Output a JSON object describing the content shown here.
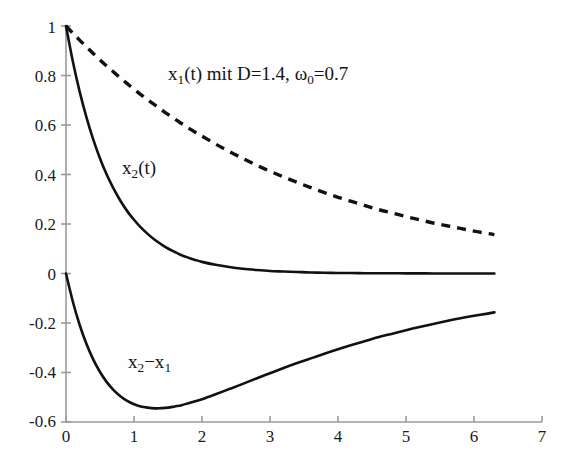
{
  "chart_data": {
    "type": "line",
    "title": "",
    "xlabel": "",
    "ylabel": "",
    "xlim": [
      0,
      7
    ],
    "ylim": [
      -0.6,
      1
    ],
    "grid": false,
    "legend_position": "inline-annotations",
    "annotation_main": "x₁(t)  mit D=1.4, ω₀=0.7",
    "annotation_main_parts": {
      "base1": "x",
      "sub1": "1",
      "mid": "(t)  mit D=1.4, ",
      "omega": "ω",
      "sub2": "0",
      "tail": "=0.7"
    },
    "xticks": [
      0,
      1,
      2,
      3,
      4,
      5,
      6,
      7
    ],
    "xtick_labels": [
      "0",
      "1",
      "2",
      "3",
      "4",
      "5",
      "6",
      "7"
    ],
    "yticks": [
      -0.6,
      -0.4,
      -0.2,
      0,
      0.2,
      0.4,
      0.6,
      0.8,
      1
    ],
    "ytick_labels": [
      "-0.6",
      "-0.4",
      "-0.2",
      "0",
      "0.2",
      "0.4",
      "0.6",
      "0.8",
      "1"
    ],
    "x": [
      0,
      0.1,
      0.2,
      0.3,
      0.4,
      0.5,
      0.6,
      0.7,
      0.8,
      0.9,
      1,
      1.1,
      1.2,
      1.3,
      1.4,
      1.5,
      1.6,
      1.7,
      1.8,
      1.9,
      2,
      2.2,
      2.4,
      2.6,
      2.8,
      3,
      3.2,
      3.4,
      3.6,
      3.8,
      4,
      4.2,
      4.4,
      4.6,
      4.8,
      5,
      5.2,
      5.4,
      5.6,
      5.8,
      6,
      6.2,
      6.3
    ],
    "series": [
      {
        "name": "x₁(t)",
        "label": "x1",
        "style": "dashed",
        "color": "#111111",
        "values": [
          1,
          0.971,
          0.943,
          0.916,
          0.889,
          0.863,
          0.838,
          0.814,
          0.79,
          0.767,
          0.745,
          0.723,
          0.702,
          0.682,
          0.662,
          0.643,
          0.624,
          0.606,
          0.588,
          0.571,
          0.555,
          0.523,
          0.493,
          0.465,
          0.438,
          0.413,
          0.39,
          0.368,
          0.347,
          0.327,
          0.308,
          0.291,
          0.274,
          0.258,
          0.244,
          0.23,
          0.217,
          0.204,
          0.193,
          0.182,
          0.171,
          0.162,
          0.157
        ]
      },
      {
        "name": "x₂(t)",
        "label": "x2",
        "style": "solid",
        "color": "#111111",
        "values": [
          1,
          0.858,
          0.736,
          0.632,
          0.542,
          0.465,
          0.399,
          0.343,
          0.294,
          0.252,
          0.217,
          0.186,
          0.16,
          0.137,
          0.118,
          0.101,
          0.087,
          0.074,
          0.064,
          0.055,
          0.047,
          0.035,
          0.026,
          0.019,
          0.014,
          0.01,
          0.008,
          0.006,
          0.004,
          0.003,
          0.002,
          0.002,
          0.001,
          0.001,
          0.001,
          0.0005,
          0.0004,
          0.0003,
          0.0002,
          0.0002,
          0.0001,
          0.0001,
          0.0001
        ]
      },
      {
        "name": "x₂−x₁",
        "label": "x2-x1",
        "style": "solid",
        "color": "#111111",
        "values": [
          0,
          -0.113,
          -0.207,
          -0.284,
          -0.347,
          -0.398,
          -0.439,
          -0.471,
          -0.496,
          -0.515,
          -0.528,
          -0.537,
          -0.542,
          -0.545,
          -0.544,
          -0.542,
          -0.537,
          -0.532,
          -0.524,
          -0.516,
          -0.508,
          -0.488,
          -0.467,
          -0.446,
          -0.424,
          -0.403,
          -0.382,
          -0.362,
          -0.343,
          -0.324,
          -0.306,
          -0.289,
          -0.273,
          -0.257,
          -0.243,
          -0.229,
          -0.216,
          -0.204,
          -0.192,
          -0.181,
          -0.171,
          -0.162,
          -0.157
        ]
      }
    ],
    "curve_labels": [
      {
        "id": "label-x2",
        "text": "x₂(t)",
        "base": "x",
        "sub": "2",
        "tail": "(t)",
        "x": 1.05,
        "y": 0.45
      },
      {
        "id": "label-x2-minus-x1",
        "text": "x₂−x₁",
        "base": "x",
        "sub": "2",
        "tail": "−x",
        "sub2": "1",
        "x": 1.05,
        "y": -0.41
      }
    ],
    "minimum_marker": {
      "x": 1.25,
      "y": -0.565
    }
  }
}
